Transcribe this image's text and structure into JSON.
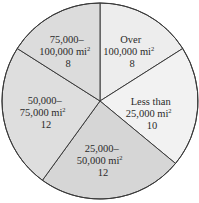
{
  "chart_data": {
    "type": "pie",
    "title": "",
    "categories": [
      "Over 100,000 mi²",
      "Less than 25,000 mi²",
      "25,000–50,000 mi²",
      "50,000–75,000 mi²",
      "75,000–100,000 mi²"
    ],
    "values": [
      8,
      10,
      12,
      12,
      8
    ],
    "slices": [
      {
        "line1": "Over",
        "line2_num": "100,000 mi",
        "sup": "2",
        "value": "8",
        "color": "#ededed"
      },
      {
        "line1": "Less than",
        "line2_num": "25,000 mi",
        "sup": "2",
        "value": "10",
        "color": "#f2f2f2"
      },
      {
        "line1": "25,000–",
        "line2_num": "50,000 mi",
        "sup": "2",
        "value": "12",
        "color": "#d6d6d6"
      },
      {
        "line1": "50,000–",
        "line2_num": "75,000 mi",
        "sup": "2",
        "value": "12",
        "color": "#dedede"
      },
      {
        "line1": "75,000–",
        "line2_num": "100,000 mi",
        "sup": "2",
        "value": "8",
        "color": "#dcdcdc"
      }
    ],
    "start_angle_deg": 0,
    "direction": "clockwise"
  }
}
